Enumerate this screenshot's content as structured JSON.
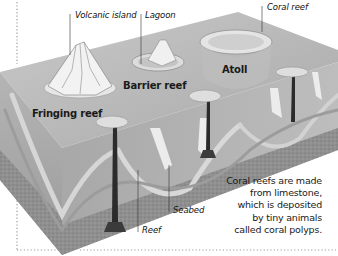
{
  "diagram": {
    "title_visible": false,
    "labels": {
      "volcanic_island": "Volcanic island",
      "lagoon": "Lagoon",
      "coral_reef": "Coral reef",
      "barrier_reef": "Barrier reef",
      "atoll": "Atoll",
      "fringing_reef": "Fringing reef",
      "seabed": "Seabed",
      "reef": "Reef"
    },
    "caption_lines": [
      "Coral reefs are made",
      "from limestone,",
      "which is deposited",
      "by tiny animals",
      "called coral polyps."
    ],
    "colors": {
      "sea_top": "#b8b8b8",
      "sea_front": "#a6a6a6",
      "seabed": "#8e8e8e",
      "reef_white": "#eeeeee",
      "chimney": "#2b2b2b",
      "border_dots": "#9a9a9a"
    }
  }
}
